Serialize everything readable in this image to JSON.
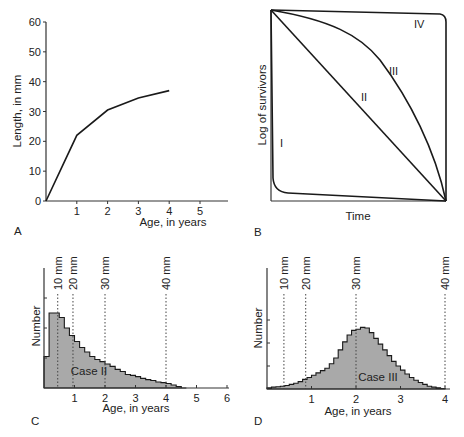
{
  "panels": {
    "A": {
      "letter": "A"
    },
    "B": {
      "letter": "B"
    },
    "C": {
      "letter": "C"
    },
    "D": {
      "letter": "D"
    }
  },
  "chart_data": [
    {
      "id": "A",
      "type": "line",
      "title": "",
      "xlabel": "Age, in years",
      "ylabel": "Length, in mm",
      "x_ticks": [
        "1",
        "2",
        "3",
        "4",
        "5"
      ],
      "y_ticks": [
        "0",
        "10",
        "20",
        "30",
        "40",
        "50",
        "60"
      ],
      "xlim": [
        0,
        6
      ],
      "ylim": [
        0,
        60
      ],
      "grid": false,
      "series": [
        {
          "name": "growth",
          "x": [
            0,
            0.5,
            1,
            2,
            3,
            4
          ],
          "y": [
            0,
            11,
            22,
            30.5,
            34.5,
            37
          ]
        }
      ]
    },
    {
      "id": "B",
      "type": "line",
      "title": "",
      "xlabel": "Time",
      "ylabel": "Log of survivors",
      "curve_labels": [
        "I",
        "II",
        "III",
        "IV"
      ],
      "xlim": [
        0,
        1
      ],
      "ylim": [
        0,
        1
      ],
      "grid": false,
      "series": [
        {
          "name": "I",
          "description": "sharp early drop then slow decline",
          "x": [
            0,
            0.02,
            0.06,
            1
          ],
          "y": [
            1,
            0.1,
            0.04,
            0
          ]
        },
        {
          "name": "II",
          "description": "linear decline",
          "x": [
            0,
            1
          ],
          "y": [
            1,
            0
          ]
        },
        {
          "name": "III",
          "description": "convex decline",
          "x": [
            0,
            0.3,
            0.6,
            0.85,
            1
          ],
          "y": [
            1,
            0.92,
            0.7,
            0.38,
            0
          ]
        },
        {
          "name": "IV",
          "description": "near-flat then sudden drop",
          "x": [
            0,
            0.97,
            1,
            1
          ],
          "y": [
            1,
            0.98,
            0.95,
            0
          ]
        }
      ]
    },
    {
      "id": "C",
      "type": "bar",
      "title": "",
      "annotation": "Case II",
      "xlabel": "Age, in years",
      "ylabel": "Number",
      "x_ticks": [
        "1",
        "2",
        "3",
        "4",
        "5",
        "6"
      ],
      "xlim": [
        0,
        6
      ],
      "ylim": [
        0,
        4
      ],
      "size_markers": [
        {
          "label": "10 mm",
          "x": 0.45
        },
        {
          "label": "20 mm",
          "x": 0.95
        },
        {
          "label": "30 mm",
          "x": 2.0
        },
        {
          "label": "40 mm",
          "x": 4.0
        }
      ],
      "bin_width": 0.1667,
      "values": [
        1.05,
        2.5,
        2.5,
        2.35,
        2.0,
        1.75,
        1.55,
        1.35,
        1.2,
        1.05,
        0.95,
        0.88,
        0.8,
        0.72,
        0.62,
        0.55,
        0.45,
        0.42,
        0.38,
        0.32,
        0.28,
        0.25,
        0.2,
        0.18,
        0.15,
        0.1,
        0.05,
        0.0
      ]
    },
    {
      "id": "D",
      "type": "bar",
      "title": "",
      "annotation": "Case III",
      "xlabel": "Age, in years",
      "ylabel": "Number",
      "x_ticks": [
        "1",
        "2",
        "3",
        "4"
      ],
      "xlim": [
        0,
        4
      ],
      "ylim": [
        0,
        4
      ],
      "size_markers": [
        {
          "label": "10 mm",
          "x": 0.38
        },
        {
          "label": "20 mm",
          "x": 0.87
        },
        {
          "label": "30 mm",
          "x": 2.0
        },
        {
          "label": "40 mm",
          "x": 4.0
        }
      ],
      "bin_width": 0.1,
      "values": [
        0.05,
        0.08,
        0.1,
        0.12,
        0.15,
        0.2,
        0.25,
        0.32,
        0.42,
        0.5,
        0.6,
        0.7,
        0.8,
        0.9,
        1.1,
        1.35,
        1.7,
        2.05,
        2.35,
        2.55,
        2.6,
        2.68,
        2.65,
        2.45,
        2.2,
        1.95,
        1.7,
        1.45,
        1.2,
        1.0,
        0.82,
        0.65,
        0.5,
        0.38,
        0.28,
        0.2,
        0.12,
        0.08,
        0.05,
        0.02
      ]
    }
  ]
}
